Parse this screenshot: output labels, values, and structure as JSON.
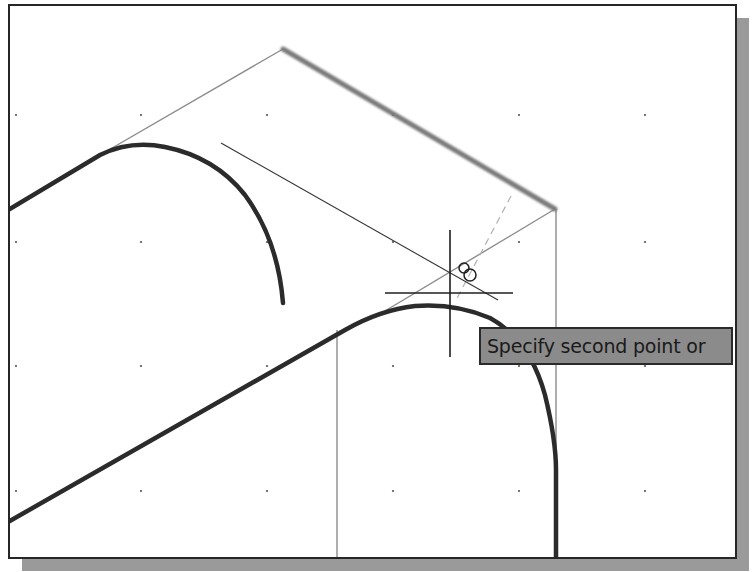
{
  "app": {
    "type": "CAD drawing viewport",
    "cursor_mode": "crosshair"
  },
  "viewport": {
    "background": "#ffffff",
    "border_color": "#262626",
    "shadow_color": "#9a9a9a",
    "grid": {
      "visible": true,
      "dot_color": "#555555",
      "x_positions": [
        16,
        141,
        267,
        393,
        519,
        645
      ],
      "y_positions": [
        115,
        242,
        366,
        491
      ]
    }
  },
  "drawing": {
    "thick_object_color": "#2b2b2b",
    "construction_line_color": "#8c8c8c",
    "highlighted_edge_color": "#7a7a7a",
    "rubber_band_color": "#333333",
    "tracking_line_color": "#b0b0b0"
  },
  "cursor": {
    "x": 450,
    "y": 293,
    "snap_marker": "intersection-snap",
    "icon": "crosshair-icon"
  },
  "tooltip": {
    "text": "Specify second point or",
    "background": "#8b8b8b"
  }
}
